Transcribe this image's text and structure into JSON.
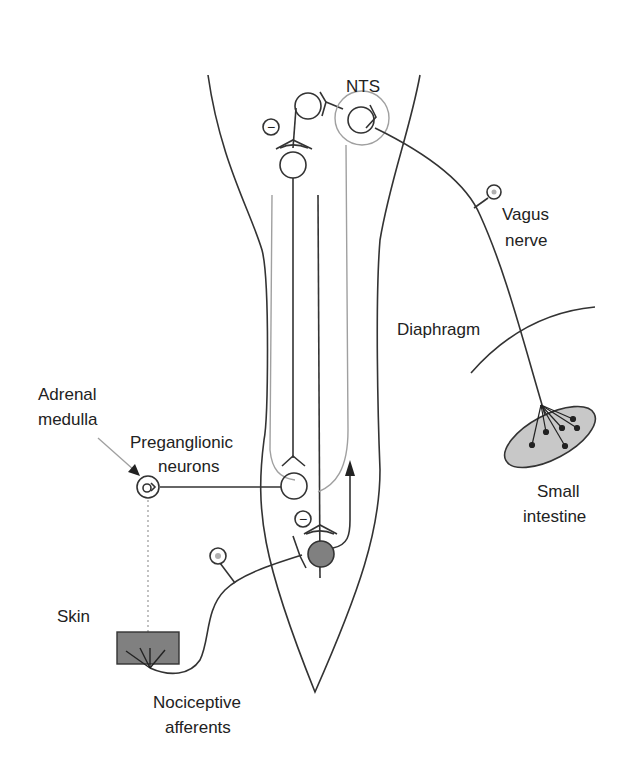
{
  "labels": {
    "nts": "NTS",
    "vagus_line1": "Vagus",
    "vagus_line2": "nerve",
    "diaphragm": "Diaphragm",
    "adrenal_line1": "Adrenal",
    "adrenal_line2": "medulla",
    "preganglionic_line1": "Preganglionic",
    "preganglionic_line2": "neurons",
    "small_intestine_line1": "Small",
    "small_intestine_line2": "intestine",
    "skin": "Skin",
    "nociceptive_line1": "Nociceptive",
    "nociceptive_line2": "afferents"
  },
  "symbols": {
    "inhibitory": "−"
  },
  "colors": {
    "line_dark": "#333333",
    "line_gray": "#a0a0a0",
    "fill_gray": "#c8c8c8",
    "fill_dark_gray": "#808080",
    "skin_fill": "#808080"
  }
}
